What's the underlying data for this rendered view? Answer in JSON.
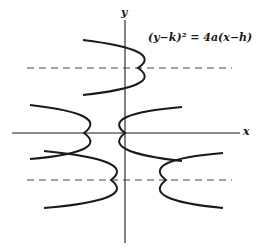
{
  "diagram": {
    "equation": "(y−k)² = 4a(x−h)",
    "axes": {
      "x_label": "x",
      "y_label": "y"
    },
    "colors": {
      "stroke": "#1a1a1a",
      "dashed": "#444444",
      "background": "#ffffff"
    },
    "curves": [
      {
        "name": "parabola-upper-opens-left",
        "vertex": [
          138,
          68
        ],
        "ends": [
          [
            83,
            40
          ],
          [
            83,
            95
          ]
        ]
      },
      {
        "name": "parabola-left-on-x-axis-opens-left",
        "vertex": [
          84,
          133
        ],
        "ends": [
          [
            30,
            105
          ],
          [
            30,
            159
          ]
        ]
      },
      {
        "name": "parabola-origin-opens-right",
        "vertex": [
          125,
          133
        ],
        "ends": [
          [
            182,
            107
          ],
          [
            182,
            161
          ]
        ]
      },
      {
        "name": "parabola-lower-left-opens-left",
        "vertex": [
          111,
          180
        ],
        "ends": [
          [
            44,
            151
          ],
          [
            44,
            208
          ]
        ]
      },
      {
        "name": "parabola-lower-right-opens-right",
        "vertex": [
          166,
          180
        ],
        "ends": [
          [
            223,
            153
          ],
          [
            223,
            208
          ]
        ]
      }
    ],
    "axis_lines": [
      "y = k (upper)",
      "y = k (lower)"
    ]
  }
}
